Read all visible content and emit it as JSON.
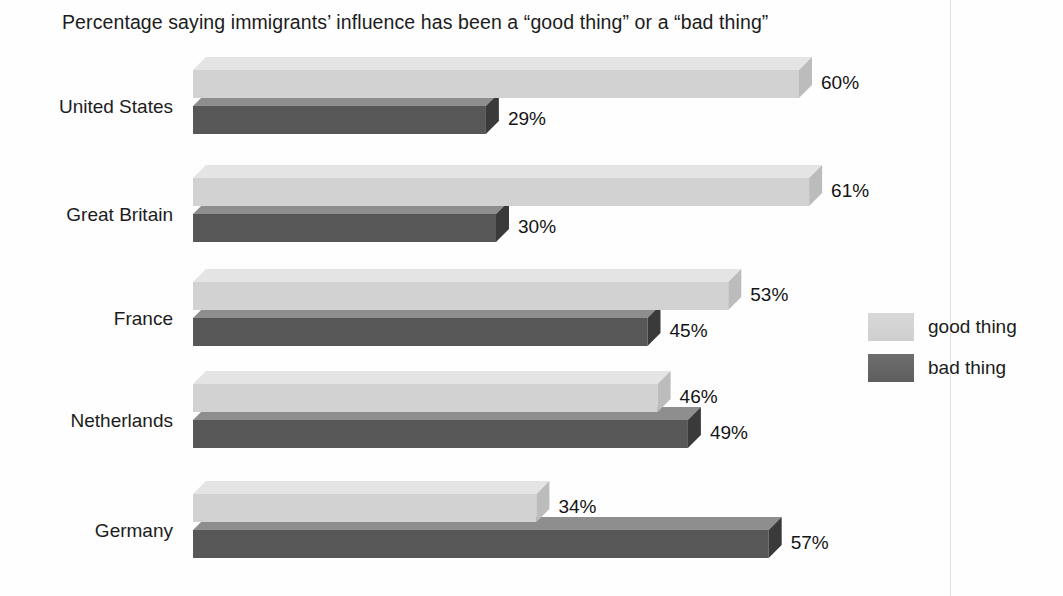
{
  "chart_data": {
    "type": "bar",
    "orientation": "horizontal",
    "title": "Percentage saying immigrants’ influence has been a “good thing” or a “bad thing”",
    "xlabel": "",
    "ylabel": "",
    "categories": [
      "United States",
      "Great Britain",
      "France",
      "Netherlands",
      "Germany"
    ],
    "series": [
      {
        "name": "good thing",
        "values": [
          60,
          61,
          53,
          46,
          34
        ],
        "value_labels": [
          "60%",
          "61%",
          "53%",
          "46%",
          "34%"
        ],
        "color": "#d2d2d2",
        "top_color": "#e4e4e4",
        "side_color": "#bcbcbc"
      },
      {
        "name": "bad thing",
        "values": [
          29,
          30,
          45,
          49,
          57
        ],
        "value_labels": [
          "29%",
          "30%",
          "45%",
          "49%",
          "57%"
        ],
        "color": "#575757",
        "top_color": "#8e8e8e",
        "side_color": "#3a3a3a"
      }
    ],
    "xlim": [
      0,
      100
    ],
    "grid": false,
    "legend_position": "right",
    "units": "percent"
  },
  "legend": {
    "items": [
      {
        "label": "good thing",
        "swatch_color": "#d8d8d8"
      },
      {
        "label": "bad thing",
        "swatch_color": "#5e5e5e"
      }
    ]
  },
  "axis": {
    "categories": [
      {
        "label": "United States"
      },
      {
        "label": "Great Britain"
      },
      {
        "label": "France"
      },
      {
        "label": "Netherlands"
      },
      {
        "label": "Germany"
      }
    ]
  },
  "values": {
    "united_states": {
      "good": "60%",
      "bad": "29%"
    },
    "great_britain": {
      "good": "61%",
      "bad": "30%"
    },
    "france": {
      "good": "53%",
      "bad": "45%"
    },
    "netherlands": {
      "good": "46%",
      "bad": "49%"
    },
    "germany": {
      "good": "34%",
      "bad": "57%"
    }
  }
}
